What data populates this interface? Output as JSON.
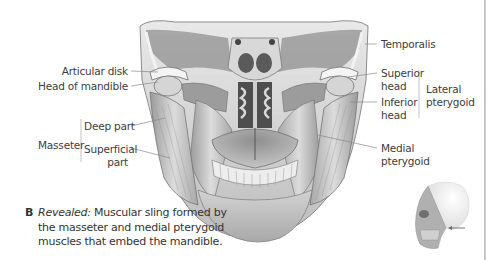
{
  "figure": {
    "letter": "B",
    "caption_title": "Revealed:",
    "caption_lines": [
      "Muscular sling formed by",
      "the masseter and medial pterygoid",
      "muscles that embed the mandible."
    ]
  },
  "labels": {
    "left": {
      "articular_disk": "Articular disk",
      "head_of_mandible": "Head of mandible",
      "masseter": "Masseter",
      "deep_part": "Deep part",
      "superficial_part_1": "Superficial",
      "superficial_part_2": "part"
    },
    "right": {
      "temporalis": "Temporalis",
      "superior_head_1": "Superior",
      "superior_head_2": "head",
      "inferior_head_1": "Inferior",
      "inferior_head_2": "head",
      "lateral_pterygoid_1": "Lateral",
      "lateral_pterygoid_2": "pterygoid",
      "medial_pterygoid_1": "Medial",
      "medial_pterygoid_2": "pterygoid"
    }
  },
  "colors": {
    "leader_line": "#8a8a8a",
    "bracket": "#b5b5b5",
    "text": "#3d3d3d",
    "arrow": "#6a6a6a"
  },
  "icons": {
    "orientation": "skull-orientation-thumbnail-icon",
    "arrow": "left-arrow-icon"
  }
}
